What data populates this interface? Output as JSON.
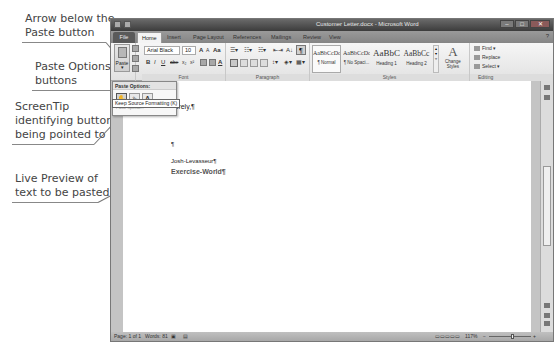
{
  "callouts": [
    {
      "id": "arrow-below-paste",
      "lines": [
        "Arrow below the",
        "Paste button"
      ]
    },
    {
      "id": "paste-options-buttons",
      "lines": [
        "Paste Options",
        "buttons"
      ]
    },
    {
      "id": "screentip",
      "lines": [
        "ScreenTip",
        "identifying button",
        "being pointed to"
      ]
    },
    {
      "id": "live-preview",
      "lines": [
        "Live Preview of",
        "text to be pasted"
      ]
    }
  ],
  "window": {
    "title": "Customer Letter.docx - Microsoft Word",
    "controls": {
      "minimize": "–",
      "maximize": "□",
      "close": "✕"
    }
  },
  "tabs": [
    {
      "label": "File"
    },
    {
      "label": "Home"
    },
    {
      "label": "Insert"
    },
    {
      "label": "Page Layout"
    },
    {
      "label": "References"
    },
    {
      "label": "Mailings"
    },
    {
      "label": "Review"
    },
    {
      "label": "View"
    }
  ],
  "ribbon": {
    "clipboard": {
      "paste_label": "Paste",
      "paste_arrow": "▾",
      "group_label": "Clipboard"
    },
    "font": {
      "font_name": "Arial Black",
      "font_size": "10",
      "grow": "A",
      "shrink": "A",
      "change_case": "Aa",
      "bold": "B",
      "italic": "I",
      "underline": "U",
      "strike": "abe",
      "subscript": "x₂",
      "superscript": "x²",
      "group_label": "Font"
    },
    "paragraph": {
      "pilcrow": "¶",
      "sort": "A↓",
      "group_label": "Paragraph"
    },
    "styles": {
      "items": [
        {
          "sample": "AaBbCcDc",
          "name": "¶ Normal"
        },
        {
          "sample": "AaBbCcDc",
          "name": "¶ No Spaci..."
        },
        {
          "sample": "AaBbC:",
          "name": "Heading 1"
        },
        {
          "sample": "AaBbCc",
          "name": "Heading 2"
        }
      ],
      "change_styles": "Change Styles",
      "group_label": "Styles"
    },
    "editing": {
      "find": "Find ▾",
      "replace": "Replace",
      "select": "Select ▾",
      "group_label": "Editing"
    }
  },
  "paste_dropdown": {
    "header": "Paste Options:",
    "buttons": [
      {
        "glyph": "✋",
        "name": "Keep Source Formatting"
      },
      {
        "glyph": "⇘",
        "name": "Merge Formatting"
      },
      {
        "glyph": "A",
        "name": "Keep Text Only"
      }
    ],
    "sub_text": "Paste Special...",
    "screentip": "Keep Source Formatting (K)"
  },
  "document": {
    "lines": [
      {
        "text": "cerely,¶"
      },
      {
        "text": "All Single Person"
      },
      {
        "text": "¶"
      },
      {
        "text": "Josh-Levasseur¶"
      },
      {
        "text": "Exercise-World¶"
      }
    ]
  },
  "statusbar": {
    "page": "Page: 1 of 1",
    "words": "Words: 81",
    "zoom": "117%",
    "zoom_out": "−",
    "zoom_in": "+"
  }
}
